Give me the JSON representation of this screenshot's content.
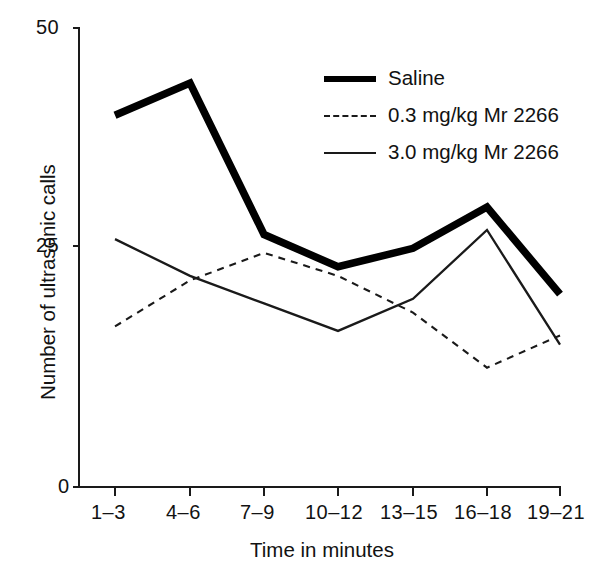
{
  "chart_data": {
    "type": "line",
    "title": "",
    "xlabel": "Time in minutes",
    "ylabel": "Number of ultrasonic calls",
    "categories": [
      "1–3",
      "4–6",
      "7–9",
      "10–12",
      "13–15",
      "16–18",
      "19–21"
    ],
    "ylim": [
      0,
      50
    ],
    "yticks": [
      0,
      25,
      50
    ],
    "ytick_labels": [
      "0",
      "25",
      "50"
    ],
    "grid": false,
    "legend_position": "upper-right-inside",
    "series": [
      {
        "name": "Saline",
        "style": "thick-solid",
        "color": "#000000",
        "values": [
          40.5,
          44.0,
          27.5,
          24.0,
          26.0,
          30.5,
          21.0
        ]
      },
      {
        "name": "0.3 mg/kg Mr 2266",
        "style": "dashed",
        "color": "#1a1a1a",
        "values": [
          17.5,
          22.5,
          25.5,
          23.0,
          19.0,
          13.0,
          16.5
        ]
      },
      {
        "name": "3.0 mg/kg Mr 2266",
        "style": "thin-solid",
        "color": "#1a1a1a",
        "values": [
          27.0,
          23.0,
          20.0,
          17.0,
          20.5,
          28.0,
          15.5
        ]
      }
    ]
  },
  "axes": {
    "y_tick_top": "50",
    "y_tick_mid": "25",
    "y_tick_bottom": "0",
    "y_title": "Number of ultrasonic  calls",
    "x_title": "Time in minutes",
    "x_tick_labels": [
      "1–3",
      "4–6",
      "7–9",
      "10–12",
      "13–15",
      "16–18",
      "19–21"
    ]
  },
  "legend": {
    "items": [
      {
        "label": "Saline",
        "swatch": "thick-solid-line-icon"
      },
      {
        "label": "0.3 mg/kg Mr 2266",
        "swatch": "dashed-line-icon"
      },
      {
        "label": "3.0 mg/kg Mr 2266",
        "swatch": "thin-solid-line-icon"
      }
    ]
  }
}
